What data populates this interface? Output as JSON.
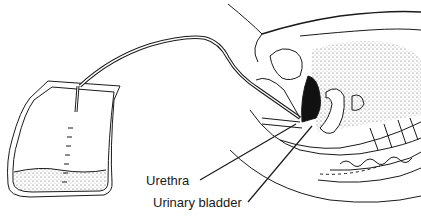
{
  "figure": {
    "labels": [
      {
        "text": "Urethra"
      },
      {
        "text": "Urinary bladder"
      }
    ],
    "components": [
      "drainage-bag",
      "catheter-tubing",
      "pelvic-cross-section"
    ],
    "colors": {
      "line": "#1a1a1a",
      "background": "#ffffff",
      "fill_dark": "#111111"
    }
  }
}
